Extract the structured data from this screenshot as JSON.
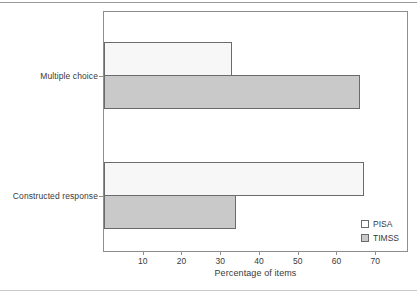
{
  "chart_data": {
    "type": "bar",
    "orientation": "horizontal",
    "title": "",
    "xlabel": "Percentage of items",
    "ylabel": "",
    "categories": [
      "Multiple choice",
      "Constructed response"
    ],
    "series": [
      {
        "name": "PISA",
        "values": [
          33,
          67
        ],
        "color": "#f7f7f7"
      },
      {
        "name": "TIMSS",
        "values": [
          66,
          34
        ],
        "color": "#c9c9c9"
      }
    ],
    "xlim": [
      0,
      78.2
    ],
    "xticks": [
      10,
      20,
      30,
      40,
      50,
      60,
      70
    ],
    "xtick_labels": [
      "10",
      "20",
      "30",
      "40",
      "50",
      "60",
      "70"
    ],
    "grid": false,
    "legend_position": "bottom-right-inside",
    "legend": [
      {
        "label": "PISA",
        "swatch": "white-square"
      },
      {
        "label": "TIMSS",
        "swatch": "gray-square"
      }
    ]
  }
}
